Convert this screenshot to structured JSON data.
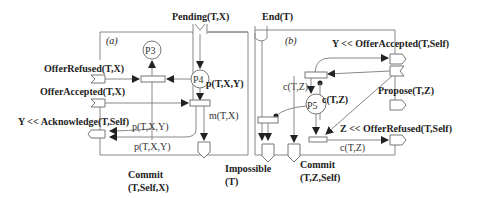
{
  "panel_a": {
    "tag": "(a)",
    "pending": "Pending(T,X)",
    "offer_refused": "OfferRefused(T,X)",
    "offer_accepted": "OfferAccepted(T,X)",
    "acknowledge": "Y << Acknowledge(T,Self)",
    "p3": "P3",
    "p4": "P4",
    "p4_label": "p(T,X,Y)",
    "m_label": "m(T,X)",
    "p_label_1": "p(T,X,Y)",
    "p_label_2": "p(T,X,Y)",
    "commit_1": "Commit",
    "commit_2": "(T,Self,X)"
  },
  "panel_b": {
    "tag": "(b)",
    "end": "End(T)",
    "offer_accepted": "Y << OfferAccepted(T,Self)",
    "propose": "Propose(T,Z)",
    "offer_refused": "Z << OfferRefused(T,Self)",
    "p5": "P5",
    "c_label_1": "c(T,Z)",
    "c_label_2": "c(T,Z)",
    "c_label_3": "c(T,Z)",
    "impossible_1": "Impossible",
    "impossible_2": "(T)",
    "commit_1": "Commit",
    "commit_2": "(T,Z,Self)"
  }
}
